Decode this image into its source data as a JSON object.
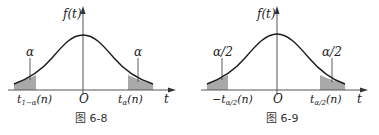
{
  "figures": [
    {
      "id": "fig-6-8",
      "caption": "图 6-8",
      "ylabel": "f(t)",
      "xlabel": "t",
      "origin": "O",
      "left_area_label": "α",
      "right_area_label": "α",
      "left_tick": "t",
      "left_tick_sub": "1−α",
      "left_tick_arg": "(n)",
      "right_tick": "t",
      "right_tick_sub": "α",
      "right_tick_arg": "(n)",
      "left_tick_prefix": ""
    },
    {
      "id": "fig-6-9",
      "caption": "图 6-9",
      "ylabel": "f(t)",
      "xlabel": "t",
      "origin": "O",
      "left_area_label": "α/2",
      "right_area_label": "α/2",
      "left_tick": "t",
      "left_tick_sub": "α/2",
      "left_tick_arg": "(n)",
      "left_tick_prefix": "−",
      "right_tick": "t",
      "right_tick_sub": "α/2",
      "right_tick_arg": "(n)"
    }
  ],
  "colors": {
    "shade": "#a9a9a9",
    "curve": "#1a1a1a",
    "axis": "#555555"
  }
}
